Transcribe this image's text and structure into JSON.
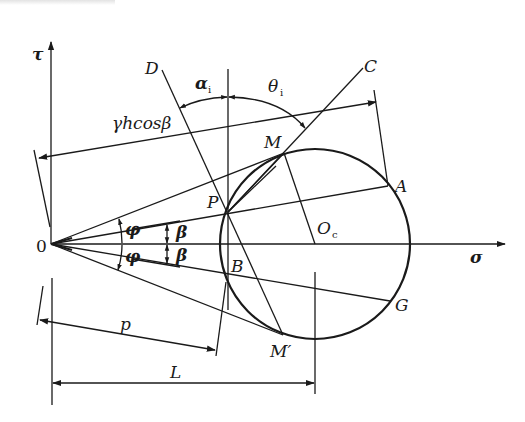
{
  "figure": {
    "type": "mohr-circle-geometric-construction",
    "axes": {
      "horizontal_label": "σ",
      "vertical_label": "τ",
      "origin_label": "0"
    },
    "points": {
      "P": "P",
      "B": "B",
      "M": "M",
      "M_prime": "M′",
      "A": "A",
      "G": "G",
      "C": "C",
      "D": "D",
      "Oc_main": "O",
      "Oc_sub": "c"
    },
    "angles": {
      "phi_upper": "φ",
      "phi_lower": "φ",
      "beta_upper": "β",
      "beta_lower": "β",
      "alpha_main": "α",
      "alpha_sub": "i",
      "theta_main": "θ",
      "theta_sub": "i"
    },
    "dimensions": {
      "top_dimension": "γhcosβ",
      "p_dimension": "p",
      "L_dimension": "L"
    },
    "colors": {
      "line": "#1a1a1a",
      "background": "#ffffff"
    }
  }
}
